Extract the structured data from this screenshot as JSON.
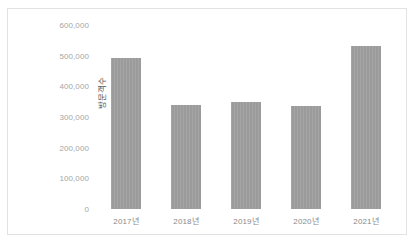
{
  "chart_data": {
    "type": "bar",
    "title": "",
    "subtitle": "",
    "xlabel": "",
    "ylabel": "방문객수",
    "categories": [
      "2017년",
      "2018년",
      "2019년",
      "2020년",
      "2021년"
    ],
    "values": [
      492000,
      339000,
      348000,
      337000,
      531000
    ],
    "series": [
      {
        "name": "방문객수",
        "values": [
          492000,
          339000,
          348000,
          337000,
          531000
        ]
      }
    ],
    "ylim": [
      0,
      600000
    ],
    "y_ticks": [
      0,
      100000,
      200000,
      300000,
      400000,
      500000,
      600000
    ],
    "y_tick_labels": [
      "0",
      "100,000",
      "200,000",
      "300,000",
      "400,000",
      "500,000",
      "600,000"
    ],
    "grid": false,
    "legend": false,
    "legend_position": "none",
    "bar_color": "#9b9b9b",
    "frame_color": "#e2e2e2",
    "tick_label_color": "#a6a6a6",
    "axis_title_color": "#595959"
  }
}
